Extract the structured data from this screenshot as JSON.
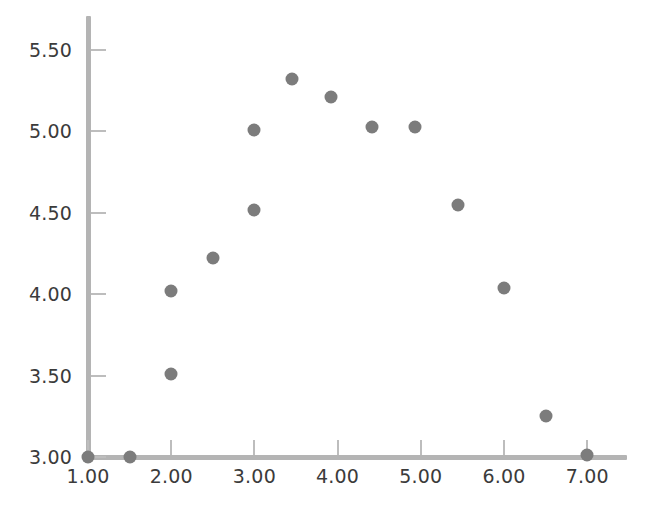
{
  "chart_data": {
    "type": "scatter",
    "title": "",
    "subtitle": "",
    "xlabel": "",
    "ylabel": "",
    "xlim": [
      1.0,
      7.5
    ],
    "ylim": [
      3.0,
      5.65
    ],
    "grid": false,
    "legend": null,
    "marker_color": "#7c7c7c",
    "axis_color": "#b4b4b4",
    "tick_color": "#bdbdbd",
    "label_color": "#3b3b3b",
    "xticks": [
      1.0,
      2.0,
      3.0,
      4.0,
      5.0,
      6.0,
      7.0
    ],
    "xtick_labels": [
      "1.00",
      "2.00",
      "3.00",
      "4.00",
      "5.00",
      "6.00",
      "7.00"
    ],
    "yticks": [
      3.0,
      3.5,
      4.0,
      4.5,
      5.0,
      5.5
    ],
    "ytick_labels": [
      "3.00",
      "3.50",
      "4.00",
      "4.50",
      "5.00",
      "5.50"
    ],
    "points": [
      {
        "x": 1.0,
        "y": 3.0
      },
      {
        "x": 1.5,
        "y": 3.0
      },
      {
        "x": 2.0,
        "y": 3.51
      },
      {
        "x": 2.0,
        "y": 4.02
      },
      {
        "x": 2.5,
        "y": 4.22
      },
      {
        "x": 3.0,
        "y": 4.52
      },
      {
        "x": 3.0,
        "y": 5.01
      },
      {
        "x": 3.45,
        "y": 5.32
      },
      {
        "x": 3.92,
        "y": 5.21
      },
      {
        "x": 4.41,
        "y": 5.03
      },
      {
        "x": 4.93,
        "y": 5.03
      },
      {
        "x": 5.45,
        "y": 4.55
      },
      {
        "x": 6.0,
        "y": 4.04
      },
      {
        "x": 6.5,
        "y": 3.25
      },
      {
        "x": 7.0,
        "y": 3.01
      }
    ]
  }
}
